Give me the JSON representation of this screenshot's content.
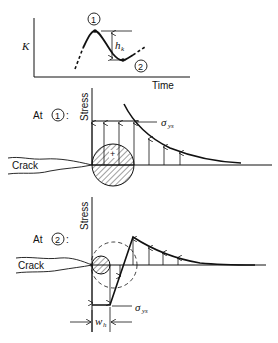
{
  "top_plot": {
    "y_label": "K",
    "x_label": "Time",
    "point_1_label": "1",
    "point_2_label": "2",
    "height_label": "h",
    "height_sub": "k"
  },
  "panel_1": {
    "prefix": "At",
    "marker": "1",
    "suffix": ":",
    "axis_label": "Stress",
    "crack_label": "Crack",
    "sigma_label": "σ",
    "sigma_sub": "ys",
    "zone_sign": "+"
  },
  "panel_2": {
    "prefix": "At",
    "marker": "2",
    "suffix": ":",
    "axis_label": "Stress",
    "crack_label": "Crack",
    "sigma_label": "σ",
    "sigma_sub": "ys",
    "width_label": "w",
    "width_sub": "h"
  },
  "colors": {
    "ink": "#111111",
    "background": "#ffffff"
  }
}
